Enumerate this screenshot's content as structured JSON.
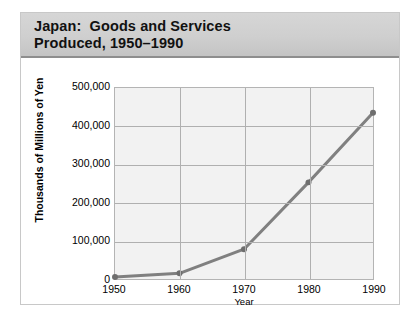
{
  "card": {
    "title_line1": "Japan:  Goods and Services",
    "title_line2": "Produced, 1950–1990"
  },
  "chart_data": {
    "type": "line",
    "xlabel": "Year",
    "ylabel": "Thousands of Millions of Yen",
    "categories": [
      "1950",
      "1960",
      "1970",
      "1980",
      "1990"
    ],
    "x": [
      1950,
      1960,
      1970,
      1980,
      1990
    ],
    "values": [
      5000,
      15000,
      78000,
      253000,
      435000
    ],
    "series": [
      {
        "name": "Goods and Services Produced",
        "values": [
          5000,
          15000,
          78000,
          253000,
          435000
        ]
      }
    ],
    "ylim": [
      0,
      500000
    ],
    "yticks": [
      0,
      100000,
      200000,
      300000,
      400000,
      500000
    ],
    "ytick_labels": [
      "0",
      "100,000",
      "200,000",
      "300,000",
      "400,000",
      "500,000"
    ],
    "xtick_labels": [
      "1950",
      "1960",
      "1970",
      "1980",
      "1990"
    ],
    "grid": true,
    "legend": false,
    "line_color": "#808080",
    "marker_color": "#6e6e6e",
    "plot_background": "#f2f2f2",
    "grid_color": "#b0b0b0"
  }
}
